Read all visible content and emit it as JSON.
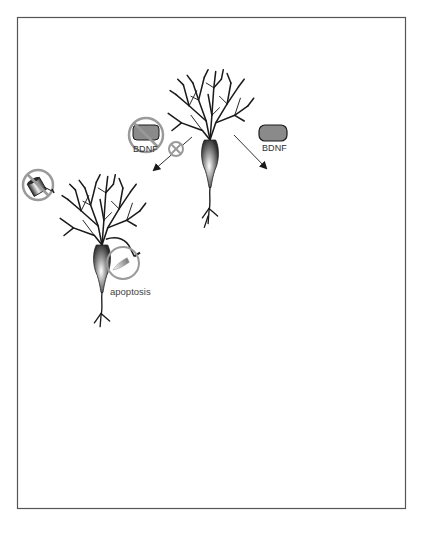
{
  "figure": {
    "frame": {
      "x": 17,
      "y": 17,
      "width": 389,
      "height": 491,
      "border_color": "#555555"
    }
  },
  "labels": {
    "bdnf_blocked": "BDNF",
    "bdnf_supplied": "BDNF",
    "apoptosis": "apoptosis"
  },
  "nodes": [
    {
      "id": "neuron-initial",
      "role": "starting neuron",
      "x": 210,
      "y": 130
    },
    {
      "id": "neuron-deprived",
      "role": "BDNF-deprived neuron undergoing apoptosis",
      "x": 100,
      "y": 255
    },
    {
      "id": "neuron-degenerated",
      "role": "degenerated neuron",
      "x": 100,
      "y": 400
    },
    {
      "id": "neuron-supplied",
      "role": "BDNF-supplied neuron",
      "x": 300,
      "y": 265
    },
    {
      "id": "neuron-grown",
      "role": "grown neuron",
      "x": 345,
      "y": 420
    }
  ],
  "icons": [
    {
      "name": "bdnf-blocked-icon",
      "meaning": "no BDNF"
    },
    {
      "name": "inhibit-icon",
      "meaning": "blocked pathway"
    },
    {
      "name": "bdnf-icon",
      "meaning": "BDNF present"
    },
    {
      "name": "watering-can-blocked-icon",
      "meaning": "no watering"
    },
    {
      "name": "watering-can-icon",
      "meaning": "watering with BDNF"
    },
    {
      "name": "knife-icon",
      "meaning": "cutting / apoptosis"
    }
  ],
  "colors": {
    "stroke": "#1a1a1a",
    "grey_fill": "#8a8a8a",
    "circle_grey": "#9a9a9a",
    "frame": "#555555"
  }
}
